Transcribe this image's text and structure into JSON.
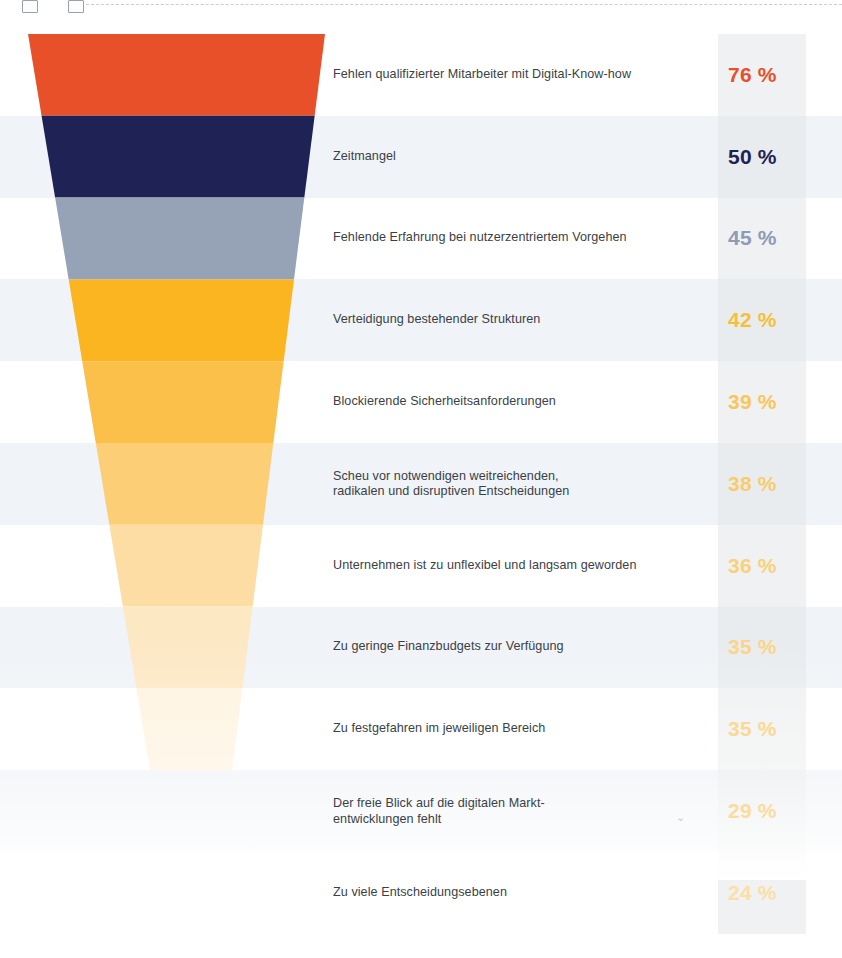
{
  "chart_data": {
    "type": "bar",
    "subtype": "funnel",
    "title": "",
    "subtitle": "",
    "xlabel": "",
    "ylabel": "",
    "unit": "%",
    "value_suffix": " %",
    "grid": false,
    "legend": false,
    "categories": [
      "Fehlen qualifizierter Mitarbeiter mit Digital-Know-how",
      "Zeitmangel",
      "Fehlende Erfahrung bei nutzerzentriertem Vorgehen",
      "Verteidigung bestehender Strukturen",
      "Blockierende Sicherheitsanforderungen",
      "Scheu vor notwendigen weitreichenden,\nradikalen und disruptiven Entscheidungen",
      "Unternehmen ist zu unflexibel und langsam geworden",
      "Zu geringe Finanzbudgets zur Verfügung",
      "Zu festgefahren im jeweiligen Bereich",
      "Der freie Blick auf die digitalen Markt-\nentwicklungen fehlt",
      "Zu viele Entscheidungsebenen"
    ],
    "values": [
      76,
      50,
      45,
      42,
      39,
      38,
      36,
      35,
      35,
      29,
      24
    ],
    "value_labels": [
      "76 %",
      "50 %",
      "45 %",
      "42 %",
      "39 %",
      "38 %",
      "36 %",
      "35 %",
      "35 %",
      "29 %",
      "24 %"
    ],
    "segment_colors": [
      "#e8502a",
      "#1e2255",
      "#96a2b6",
      "#fab520",
      "#fbc04a",
      "#fccf76",
      "#fddda3",
      "#fde8c4",
      "#fef3e0",
      "#fffaf1",
      "#ffffff"
    ],
    "value_colors": [
      "#e8502a",
      "#1e2255",
      "#8d9bb5",
      "#f7bf38",
      "#f8c659",
      "#f9cc6b",
      "#f9d178",
      "#fad589",
      "#fad992",
      "#fbdc9c",
      "#fbdfa6"
    ],
    "ylim": [
      0,
      76
    ]
  },
  "palette": {
    "row_tint": "#e6ecf2",
    "pct_column_bg": "#e3e5e8",
    "label_text": "#3b3f46",
    "page_background": "#ffffff",
    "accent_red": "#e8502a",
    "accent_navy": "#1e2255",
    "accent_slate": "#96a2b6",
    "accent_amber": "#fab520"
  },
  "artifact": {
    "speck": "⌄"
  }
}
